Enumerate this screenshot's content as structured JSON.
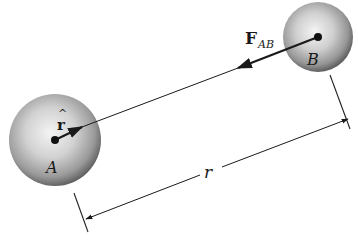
{
  "diagram": {
    "type": "physics-free-body",
    "colors": {
      "line": "#1a1a1a",
      "sphere_light": "#f4f4f4",
      "sphere_mid": "#b0b0b0",
      "sphere_dark": "#5a5a5a",
      "background": "#ffffff"
    },
    "particles": [
      {
        "id": "A",
        "label": "A",
        "cx": 55,
        "cy": 140,
        "radius": 46
      },
      {
        "id": "B",
        "label": "B",
        "cx": 318,
        "cy": 37,
        "radius": 35
      }
    ],
    "vectors": {
      "force": {
        "label_main": "F",
        "label_sub": "AB",
        "from": [
          318,
          37
        ],
        "to": [
          238,
          68
        ]
      },
      "unit": {
        "label": "r",
        "hat": "^",
        "from": [
          55,
          140
        ],
        "to": [
          82,
          127
        ]
      }
    },
    "dimension": {
      "label": "r",
      "start": [
        86,
        219
      ],
      "end": [
        348,
        119
      ]
    }
  }
}
